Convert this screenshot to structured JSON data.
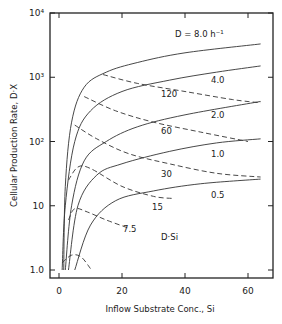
{
  "chart_data": {
    "type": "line",
    "title": "",
    "xlabel": "Inflow Substrate Conc., S",
    "xlabel_sub": "i",
    "ylabel": "Cellular Production Rate, D·X",
    "xscale": "linear",
    "yscale": "log",
    "xlim": [
      -3,
      68
    ],
    "ylim": [
      0.85,
      10000
    ],
    "x_ticks": [
      0,
      20,
      40,
      60
    ],
    "x_tick_labels": [
      "0",
      "20",
      "40",
      "60"
    ],
    "y_ticks": [
      1,
      10,
      100,
      1000,
      10000
    ],
    "y_tick_labels": [
      "1.0",
      "10",
      "10²",
      "10³",
      "10⁴"
    ],
    "grid": false,
    "series_solid": [
      {
        "name": "D = 8.0 h⁻¹",
        "D": 8.0,
        "label": "D = 8.0 h⁻¹",
        "points": [
          [
            1.5,
            1
          ],
          [
            2,
            20
          ],
          [
            4,
            200
          ],
          [
            8,
            700
          ],
          [
            15,
            1200
          ],
          [
            25,
            1700
          ],
          [
            40,
            2400
          ],
          [
            64,
            3300
          ]
        ]
      },
      {
        "name": "D = 4.0",
        "D": 4.0,
        "label": "4.0",
        "points": [
          [
            1,
            1
          ],
          [
            2,
            10
          ],
          [
            5,
            100
          ],
          [
            10,
            300
          ],
          [
            20,
            600
          ],
          [
            35,
            900
          ],
          [
            50,
            1200
          ],
          [
            64,
            1500
          ]
        ]
      },
      {
        "name": "D = 2.0",
        "D": 2.0,
        "label": "2.0",
        "points": [
          [
            2,
            1
          ],
          [
            4,
            10
          ],
          [
            8,
            50
          ],
          [
            15,
            100
          ],
          [
            25,
            170
          ],
          [
            40,
            260
          ],
          [
            64,
            420
          ]
        ]
      },
      {
        "name": "D = 1.0",
        "D": 1.0,
        "label": "1.0",
        "points": [
          [
            3,
            1
          ],
          [
            6,
            10
          ],
          [
            12,
            30
          ],
          [
            20,
            45
          ],
          [
            35,
            70
          ],
          [
            50,
            95
          ],
          [
            64,
            110
          ]
        ]
      },
      {
        "name": "D = 0.5",
        "D": 0.5,
        "label": "0.5",
        "points": [
          [
            5,
            1
          ],
          [
            10,
            5
          ],
          [
            18,
            12
          ],
          [
            30,
            17
          ],
          [
            45,
            22
          ],
          [
            64,
            26
          ]
        ]
      }
    ],
    "series_dashed": [
      {
        "name": "D·Si = 120",
        "label": "120",
        "points": [
          [
            14,
            1100
          ],
          [
            25,
            800
          ],
          [
            40,
            600
          ],
          [
            55,
            450
          ],
          [
            64,
            400
          ]
        ]
      },
      {
        "name": "D·Si = 60",
        "label": "60",
        "points": [
          [
            8,
            500
          ],
          [
            18,
            300
          ],
          [
            30,
            200
          ],
          [
            45,
            140
          ],
          [
            60,
            100
          ]
        ]
      },
      {
        "name": "D·Si = 30",
        "label": "30",
        "points": [
          [
            5,
            180
          ],
          [
            12,
            110
          ],
          [
            22,
            65
          ],
          [
            35,
            45
          ],
          [
            50,
            32
          ],
          [
            64,
            28
          ]
        ]
      },
      {
        "name": "D·Si = 15",
        "label": "15",
        "points": [
          [
            3,
            25
          ],
          [
            6,
            40
          ],
          [
            10,
            38
          ],
          [
            20,
            20
          ],
          [
            30,
            14
          ],
          [
            36,
            13
          ]
        ]
      },
      {
        "name": "D·Si = 7.5",
        "label": "7.5",
        "points": [
          [
            3,
            6
          ],
          [
            5,
            9
          ],
          [
            9,
            8
          ],
          [
            15,
            6
          ],
          [
            22,
            4.5
          ]
        ]
      },
      {
        "name": "D·Si = 3.75",
        "label": "",
        "points": [
          [
            1,
            1.3
          ],
          [
            4,
            1.7
          ],
          [
            7,
            1.6
          ],
          [
            10,
            1.05
          ]
        ]
      }
    ],
    "annotations": [
      "D = 8.0 h⁻¹",
      "4.0",
      "2.0",
      "1.0",
      "0.5",
      "120",
      "60",
      "30",
      "15",
      "7.5",
      "D·Si"
    ]
  }
}
